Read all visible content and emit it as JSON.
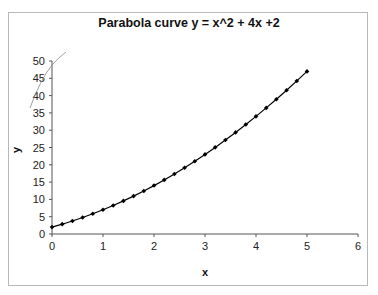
{
  "chart_data": {
    "type": "line",
    "title": "Parabola curve y = x^2 + 4x +2",
    "xlabel": "x",
    "ylabel": "y",
    "xlim": [
      0,
      6
    ],
    "ylim": [
      0,
      50
    ],
    "x_ticks": [
      "0",
      "1",
      "2",
      "3",
      "4",
      "5",
      "6"
    ],
    "y_ticks": [
      "0",
      "5",
      "10",
      "15",
      "20",
      "25",
      "30",
      "35",
      "40",
      "45",
      "50"
    ],
    "grid": false,
    "legend": null,
    "marker": "diamond",
    "line_color": "#000000",
    "series": [
      {
        "name": "y = x^2 + 4x + 2",
        "x": [
          0,
          0.2,
          0.4,
          0.6,
          0.8,
          1.0,
          1.2,
          1.4,
          1.6,
          1.8,
          2.0,
          2.2,
          2.4,
          2.6,
          2.8,
          3.0,
          3.2,
          3.4,
          3.6,
          3.8,
          4.0,
          4.2,
          4.4,
          4.6,
          4.8,
          5.0
        ],
        "values": [
          2,
          2.84,
          3.76,
          4.76,
          5.84,
          7,
          8.24,
          9.56,
          10.96,
          12.44,
          14,
          15.64,
          17.36,
          19.16,
          21.04,
          23,
          25.04,
          27.16,
          29.36,
          31.64,
          34,
          36.44,
          38.96,
          41.56,
          44.24,
          47
        ]
      }
    ],
    "annotations": [
      "stray freehand stroke near top-left of y-axis"
    ]
  }
}
